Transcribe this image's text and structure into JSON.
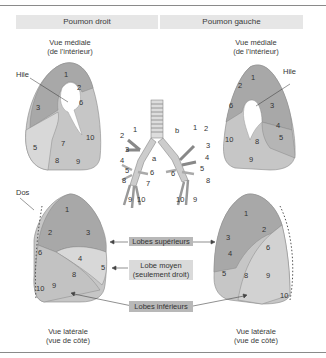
{
  "header": {
    "right_lung": "Poumon droit",
    "left_lung": "Poumon gauche"
  },
  "views": {
    "medial_right": {
      "line1": "Vue médiale",
      "line2": "(de l'intérieur)"
    },
    "medial_left": {
      "line1": "Vue médiale",
      "line2": "(de l'intérieur)"
    },
    "lateral_right": {
      "line1": "Vue latérale",
      "line2": "(vue de côté)"
    },
    "lateral_left": {
      "line1": "Vue latérale",
      "line2": "(vue de côté)"
    }
  },
  "labels": {
    "hile_right": "Hile",
    "hile_left": "Hile",
    "dos": "Dos",
    "bronchus_a": "a",
    "bronchus_b": "b"
  },
  "lobe_tags": {
    "superior": "Lobes supérieurs",
    "middle_line1": "Lobe moyen",
    "middle_line2": "(seulement droit)",
    "inferior": "Lobes inférieurs"
  },
  "segments": {
    "right_medial": [
      "1",
      "2",
      "3",
      "5",
      "6",
      "7",
      "8",
      "9",
      "10"
    ],
    "left_medial": [
      "1",
      "2",
      "3",
      "4",
      "5",
      "6",
      "8",
      "9",
      "10"
    ],
    "right_lateral": [
      "1",
      "2",
      "3",
      "4",
      "5",
      "6",
      "8",
      "9",
      "10"
    ],
    "left_lateral": [
      "1",
      "2",
      "3",
      "4",
      "5",
      "6",
      "8",
      "9",
      "10"
    ],
    "bronchi_right": [
      "1",
      "2",
      "3",
      "4",
      "5",
      "6",
      "7",
      "8",
      "9",
      "10"
    ],
    "bronchi_left": [
      "1",
      "2",
      "3",
      "4",
      "5",
      "6",
      "8",
      "10",
      "9"
    ]
  },
  "colors": {
    "upper_lobe": "#a9a9a9",
    "middle_lobe": "#d4d4d4",
    "lower_lobe": "#c2c2c2",
    "tag_dark": "#b8b8b8",
    "tag_light": "#dadada"
  }
}
